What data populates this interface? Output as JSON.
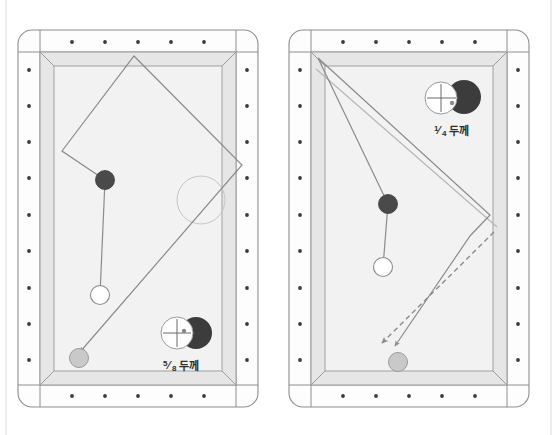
{
  "page": {
    "background_color": "#ffffff",
    "width": 557,
    "height": 435,
    "left_margin_rule_x": 6,
    "right_margin_rule_x": 551
  },
  "palette": {
    "rail_fill": "#fdfdfd",
    "rail_stroke": "#8e8e8e",
    "cushion_fill": "#e6e6e6",
    "cushion_stroke": "#9a9a9a",
    "cloth_fill": "#f2f2f2",
    "cloth_stroke": "#a0a0a0",
    "diamond_dot": "#3a3a3a",
    "object_ball_dark": "#4a4a4a",
    "cue_ball_white": "#ffffff",
    "cue_ball_stroke": "#8a8a8a",
    "target_ball_grey": "#c9c9c9",
    "target_ball_stroke": "#9b9b9b",
    "path_line": "#8b8b8b",
    "ghost_circle": "#c4c4c4",
    "contact_dark": "#3c3c3c",
    "text": "#2e2e2e"
  },
  "tables": [
    {
      "id": "left-table",
      "name": "left-diagram",
      "outer": {
        "x": 18,
        "y": 30,
        "width": 240,
        "height": 377,
        "corner_radius": 14
      },
      "rail_band": 22,
      "diamonds": {
        "top_count": 5,
        "bottom_count": 5,
        "left_count": 9,
        "right_count": 9,
        "dot_radius": 1.9
      },
      "balls": [
        {
          "name": "object-ball-dark",
          "kind": "object",
          "cx": 105,
          "cy": 180,
          "r": 9.5,
          "fill": "#4a4a4a"
        },
        {
          "name": "cue-ball-white",
          "kind": "cue",
          "cx": 100,
          "cy": 295,
          "r": 9.5,
          "fill": "#ffffff"
        },
        {
          "name": "target-ball-grey",
          "kind": "target",
          "cx": 79,
          "cy": 358,
          "r": 9.5,
          "fill": "#c9c9c9"
        }
      ],
      "ghost_circle": {
        "name": "ghost-ball-outline",
        "cx": 201,
        "cy": 200,
        "r": 24
      },
      "aim_line": {
        "from": [
          100,
          295
        ],
        "to": [
          105,
          180
        ]
      },
      "path": {
        "name": "cue-ball-path",
        "style": "solid",
        "points": [
          [
            105,
            180
          ],
          [
            62,
            151
          ],
          [
            134,
            56
          ],
          [
            242,
            165
          ],
          [
            80,
            352
          ]
        ],
        "arrow_at_end": true
      },
      "contact_label": {
        "name": "contact-thickness-label",
        "text": "5/8두께",
        "numerator": "5",
        "denominator": "8",
        "suffix": "두께",
        "x": 185,
        "y": 368,
        "icon": {
          "name": "contact-point-icon",
          "ghost_cx": 177,
          "ghost_cy": 333,
          "ghost_r": 16,
          "dark_cx": 196,
          "dark_cy": 333,
          "dark_r": 16,
          "dot_cx": 184,
          "dot_cy": 331,
          "dot_r": 2.2
        }
      }
    },
    {
      "id": "right-table",
      "name": "right-diagram",
      "outer": {
        "x": 289,
        "y": 30,
        "width": 240,
        "height": 377,
        "corner_radius": 14
      },
      "rail_band": 22,
      "diamonds": {
        "top_count": 5,
        "bottom_count": 5,
        "left_count": 9,
        "right_count": 9,
        "dot_radius": 1.9
      },
      "balls": [
        {
          "name": "object-ball-dark",
          "kind": "object",
          "cx": 388,
          "cy": 204,
          "r": 9.5,
          "fill": "#4a4a4a"
        },
        {
          "name": "cue-ball-white",
          "kind": "cue",
          "cx": 383,
          "cy": 267,
          "r": 9.5,
          "fill": "#ffffff"
        },
        {
          "name": "target-ball-grey",
          "kind": "target",
          "cx": 398,
          "cy": 362,
          "r": 9.5,
          "fill": "#c9c9c9"
        }
      ],
      "aim_line": {
        "from": [
          383,
          267
        ],
        "to": [
          388,
          204
        ]
      },
      "paths": [
        {
          "name": "cue-ball-path-primary",
          "style": "solid",
          "points": [
            [
              388,
              204
            ],
            [
              318,
              58
            ],
            [
              490,
              215
            ],
            [
              470,
              236
            ],
            [
              395,
              346
            ]
          ],
          "arrow_at_end": true
        },
        {
          "name": "cue-ball-path-secondary",
          "style": "solid",
          "points": [
            [
              316,
              69
            ],
            [
              497,
              227
            ]
          ],
          "arrow_at_end": false
        },
        {
          "name": "cue-ball-path-dashed",
          "style": "dashed",
          "points": [
            [
              494,
              232
            ],
            [
              382,
              343
            ]
          ],
          "arrow_at_end": true
        }
      ],
      "contact_label": {
        "name": "contact-thickness-label",
        "text": "¼두께",
        "numerator": "1",
        "denominator": "4",
        "suffix": "두께",
        "x": 455,
        "y": 134,
        "icon": {
          "name": "contact-point-icon",
          "ghost_cx": 441,
          "ghost_cy": 98,
          "ghost_r": 16,
          "dark_cx": 464,
          "dark_cy": 97,
          "dark_r": 17,
          "dot_cx": 452,
          "dot_cy": 103,
          "dot_r": 2.2
        }
      }
    }
  ]
}
